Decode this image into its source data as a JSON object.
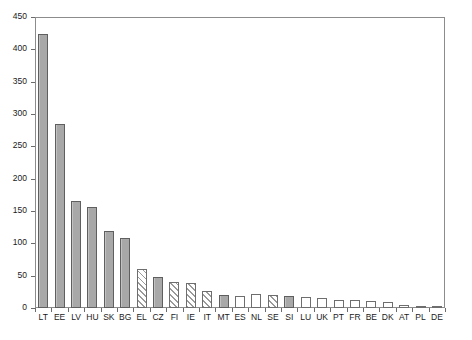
{
  "chart_data": {
    "type": "bar",
    "title": "",
    "subtitle": "",
    "xlabel": "",
    "ylabel": "",
    "ylim": [
      0,
      450
    ],
    "ytick_step": 50,
    "grid": false,
    "legend": "none",
    "categories": [
      "LT",
      "EE",
      "LV",
      "HU",
      "SK",
      "BG",
      "EL",
      "CZ",
      "FI",
      "IE",
      "IT",
      "MT",
      "ES",
      "NL",
      "SE",
      "SI",
      "LU",
      "UK",
      "PT",
      "FR",
      "BE",
      "DK",
      "AT",
      "PL",
      "DE"
    ],
    "values": [
      424,
      285,
      166,
      156,
      119,
      108,
      61,
      48,
      41,
      38,
      26,
      20,
      19,
      22,
      20,
      19,
      17,
      15,
      12,
      12,
      11,
      10,
      4,
      3,
      2
    ],
    "fills": [
      "solid",
      "solid",
      "solid",
      "solid",
      "solid",
      "solid",
      "hatch",
      "solid",
      "hatch",
      "hatch",
      "hatch",
      "solid",
      "empty",
      "empty",
      "hatch",
      "solid",
      "empty",
      "empty",
      "empty",
      "empty",
      "empty",
      "empty",
      "empty",
      "empty",
      "empty"
    ],
    "ytick_labels": [
      "0",
      "50",
      "100",
      "150",
      "200",
      "250",
      "300",
      "350",
      "400",
      "450"
    ],
    "ytick_values": [
      0,
      50,
      100,
      150,
      200,
      250,
      300,
      350,
      400,
      450
    ]
  },
  "colors": {
    "bar_solid": "#a8a8a8",
    "bar_outline": "#6e6e6e",
    "hatch_line": "#9a9a9a",
    "axis": "#8c8c8c",
    "text": "#1a1a1a",
    "background": "#ffffff"
  },
  "axes": {
    "y_axis_name": "value-axis",
    "x_axis_name": "country-axis"
  }
}
